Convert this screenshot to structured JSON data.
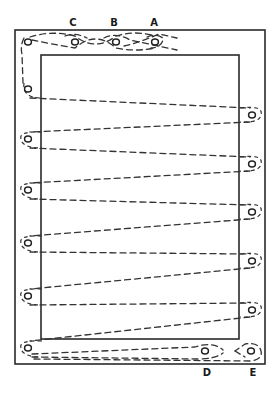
{
  "diagram": {
    "colors": {
      "line": "#333333",
      "frame": "#2a2a2a",
      "background": "#ffffff"
    },
    "outer_frame": {
      "x": 15,
      "y": 30,
      "width": 250,
      "height": 334
    },
    "inner_frame": {
      "x": 41,
      "y": 55,
      "width": 198,
      "height": 284
    },
    "labels": [
      {
        "id": "C",
        "text": "C",
        "x": 73,
        "y": 26
      },
      {
        "id": "B",
        "text": "B",
        "x": 114,
        "y": 26
      },
      {
        "id": "A",
        "text": "A",
        "x": 154,
        "y": 26
      },
      {
        "id": "D",
        "text": "D",
        "x": 207,
        "y": 376
      },
      {
        "id": "E",
        "text": "E",
        "x": 253,
        "y": 376
      }
    ],
    "eyelets": {
      "top": [
        {
          "x": 28,
          "y": 42
        },
        {
          "id": "C",
          "x": 75,
          "y": 42
        },
        {
          "id": "B",
          "x": 116,
          "y": 42
        },
        {
          "id": "A",
          "x": 155,
          "y": 42
        }
      ],
      "left": [
        {
          "x": 28,
          "y": 89
        },
        {
          "x": 28,
          "y": 139
        },
        {
          "x": 28,
          "y": 190
        },
        {
          "x": 28,
          "y": 243
        },
        {
          "x": 28,
          "y": 296
        },
        {
          "x": 28,
          "y": 348
        }
      ],
      "right": [
        {
          "x": 252,
          "y": 115
        },
        {
          "x": 252,
          "y": 164
        },
        {
          "x": 252,
          "y": 212
        },
        {
          "x": 252,
          "y": 261
        },
        {
          "x": 252,
          "y": 310
        }
      ],
      "bottom": [
        {
          "id": "D",
          "x": 205,
          "y": 351
        },
        {
          "id": "E",
          "x": 251,
          "y": 351
        }
      ]
    }
  }
}
